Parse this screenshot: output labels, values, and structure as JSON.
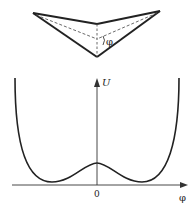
{
  "molecule": {
    "description": "Pyramidal molecule with inversion angle",
    "angle_label": "φ",
    "points": {
      "left_tip": [
        33,
        13
      ],
      "right_tip": [
        160,
        11
      ],
      "top_center": [
        97,
        24
      ],
      "apex": [
        97,
        57
      ],
      "center": [
        97,
        39
      ]
    }
  },
  "plot": {
    "y_axis_label": "U",
    "x_axis_label": "φ",
    "origin_label": "0",
    "curve_description": "double-well potential: two minima symmetric around a central barrier at φ=0",
    "colors": {
      "line": "#222222",
      "background": "#ffffff"
    }
  }
}
